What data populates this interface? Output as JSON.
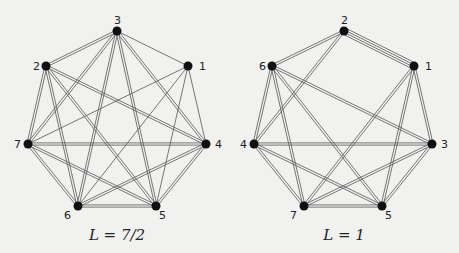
{
  "graphs": [
    {
      "id": "left",
      "caption": "L = 7/2",
      "caption_pos": [
        117,
        240
      ],
      "nodes": [
        {
          "id": "1",
          "x": 188,
          "y": 66,
          "lx": 199,
          "ly": 70
        },
        {
          "id": "2",
          "x": 46,
          "y": 66,
          "lx": 33,
          "ly": 70
        },
        {
          "id": "3",
          "x": 117,
          "y": 31,
          "lx": 114,
          "ly": 24
        },
        {
          "id": "4",
          "x": 206,
          "y": 144,
          "lx": 215,
          "ly": 148
        },
        {
          "id": "5",
          "x": 156,
          "y": 206,
          "lx": 159,
          "ly": 219
        },
        {
          "id": "6",
          "x": 78,
          "y": 206,
          "lx": 64,
          "ly": 219
        },
        {
          "id": "7",
          "x": 28,
          "y": 144,
          "lx": 14,
          "ly": 148
        }
      ],
      "edges": [
        [
          "3",
          "2",
          2
        ],
        [
          "3",
          "1",
          1
        ],
        [
          "3",
          "7",
          2
        ],
        [
          "3",
          "6",
          2
        ],
        [
          "3",
          "5",
          2
        ],
        [
          "3",
          "4",
          2
        ],
        [
          "2",
          "7",
          2
        ],
        [
          "2",
          "6",
          2
        ],
        [
          "2",
          "5",
          2
        ],
        [
          "2",
          "4",
          2
        ],
        [
          "1",
          "7",
          1
        ],
        [
          "1",
          "6",
          1
        ],
        [
          "1",
          "5",
          1
        ],
        [
          "1",
          "4",
          1
        ],
        [
          "7",
          "4",
          2
        ],
        [
          "7",
          "6",
          2
        ],
        [
          "7",
          "5",
          2
        ],
        [
          "4",
          "6",
          2
        ],
        [
          "4",
          "5",
          2
        ],
        [
          "6",
          "5",
          2
        ]
      ]
    },
    {
      "id": "right",
      "caption": "L = 1",
      "caption_pos": [
        344,
        240
      ],
      "nodes": [
        {
          "id": "1",
          "x": 414,
          "y": 66,
          "lx": 425,
          "ly": 70
        },
        {
          "id": "2",
          "x": 344,
          "y": 31,
          "lx": 341,
          "ly": 24
        },
        {
          "id": "3",
          "x": 432,
          "y": 144,
          "lx": 441,
          "ly": 148
        },
        {
          "id": "4",
          "x": 254,
          "y": 144,
          "lx": 240,
          "ly": 148
        },
        {
          "id": "5",
          "x": 382,
          "y": 206,
          "lx": 385,
          "ly": 219
        },
        {
          "id": "6",
          "x": 272,
          "y": 66,
          "lx": 259,
          "ly": 70
        },
        {
          "id": "7",
          "x": 304,
          "y": 206,
          "lx": 290,
          "ly": 219
        }
      ],
      "edges": [
        [
          "2",
          "1",
          4
        ],
        [
          "2",
          "6",
          2
        ],
        [
          "2",
          "4",
          2
        ],
        [
          "1",
          "7",
          2
        ],
        [
          "1",
          "5",
          2
        ],
        [
          "1",
          "3",
          2
        ],
        [
          "6",
          "4",
          2
        ],
        [
          "6",
          "7",
          2
        ],
        [
          "6",
          "5",
          2
        ],
        [
          "6",
          "3",
          2
        ],
        [
          "4",
          "3",
          2
        ],
        [
          "4",
          "7",
          2
        ],
        [
          "4",
          "5",
          2
        ],
        [
          "3",
          "7",
          2
        ],
        [
          "3",
          "5",
          2
        ],
        [
          "7",
          "5",
          2
        ]
      ]
    }
  ],
  "style": {
    "edge_color": "#555555",
    "node_color": "#111111",
    "background": "#f1f1ef"
  }
}
